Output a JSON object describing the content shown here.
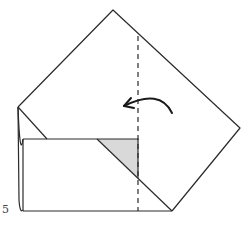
{
  "diagram": {
    "type": "origami-fold-step",
    "step_number": "5",
    "colors": {
      "line": "#2a2a2a",
      "shade": "#d9d9d9",
      "background": "#ffffff"
    },
    "elements": {
      "outline": "square paper rotated as diamond, bottom-left corner folded up into rectangle",
      "fold_line": "vertical dashed valley fold line",
      "arrow": "curved arrow pointing left indicating fold direction",
      "shaded_region": "gray triangle showing colored side of paper"
    }
  }
}
